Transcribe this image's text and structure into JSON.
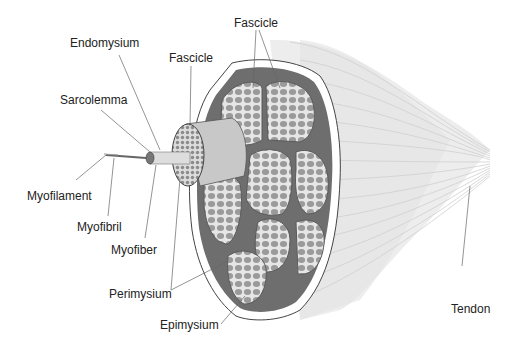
{
  "diagram": {
    "labels": {
      "endomysium": "Endomysium",
      "fascicle_left": "Fascicle",
      "fascicle_top": "Fascicle",
      "sarcolemma": "Sarcolemma",
      "myofilament": "Myofilament",
      "myofibril": "Myofibril",
      "myofiber": "Myofiber",
      "perimysium": "Perimysium",
      "epimysium": "Epimysium",
      "tendon": "Tendon"
    },
    "colors": {
      "epimysium_outer": "#ffffff",
      "perimysium_dark": "#6e6e6e",
      "fascicle_fill": "#e8e8e8",
      "myofiber_fill": "#9a9a9a",
      "tendon_fill": "#ececec",
      "line": "#555555"
    }
  }
}
